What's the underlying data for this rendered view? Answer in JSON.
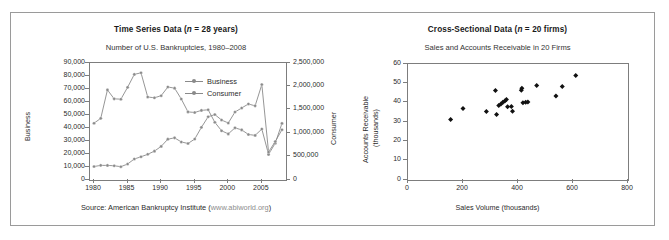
{
  "figure": {
    "border_color": "#9a9a9a",
    "background": "#ffffff"
  },
  "panels": [
    {
      "id": "time-series",
      "title_main": "Time Series Data (",
      "title_ital": "n",
      "title_tail": " = 28 years)",
      "subtitle": "Number of U.S. Bankruptcies, 1980–2008",
      "caption_prefix": "Source: American Bankruptcy Institute (",
      "caption_url": "www.abiworld.org",
      "caption_suffix": ")",
      "legend": [
        {
          "label": "Business",
          "color": "#8a8a8a"
        },
        {
          "label": "Consumer",
          "color": "#8a8a8a"
        }
      ]
    },
    {
      "id": "cross-sectional",
      "title_main": "Cross-Sectional Data (",
      "title_ital": "n",
      "title_tail": " = 20 firms)",
      "subtitle": "Sales and Accounts Receivable in 20 Firms"
    }
  ],
  "chart_data": [
    {
      "type": "line",
      "id": "time-series",
      "title": "Time Series Data (n = 28 years)",
      "subtitle": "Number of U.S. Bankruptcies, 1980–2008",
      "source": "Source: American Bankruptcy Institute (www.abiworld.org)",
      "xlabel": "",
      "x": [
        1980,
        1981,
        1982,
        1983,
        1984,
        1985,
        1986,
        1987,
        1988,
        1989,
        1990,
        1991,
        1992,
        1993,
        1994,
        1995,
        1996,
        1997,
        1998,
        1999,
        2000,
        2001,
        2002,
        2003,
        2004,
        2005,
        2006,
        2007,
        2008
      ],
      "xlim": [
        1979.4,
        2008.6
      ],
      "xticks": [
        1980,
        1985,
        1990,
        1995,
        2000,
        2005
      ],
      "grid": false,
      "legend_position": "top-center-right",
      "series": [
        {
          "name": "Business",
          "axis": "left",
          "ylabel": "Business",
          "ylim": [
            0,
            90000
          ],
          "yticks": [
            0,
            10000,
            20000,
            30000,
            40000,
            50000,
            60000,
            70000,
            80000,
            90000
          ],
          "ytick_labels": [
            "0",
            "10,000",
            "20,000",
            "30,000",
            "40,000",
            "50,000",
            "60,000",
            "70,000",
            "80,000",
            "90,000"
          ],
          "color": "#8a8a8a",
          "values": [
            43694,
            47415,
            69300,
            62436,
            62170,
            71277,
            81235,
            82446,
            63853,
            63235,
            64853,
            71549,
            70643,
            62304,
            52374,
            51959,
            53549,
            54027,
            44367,
            37884,
            35472,
            40099,
            38540,
            35037,
            34317,
            39201,
            19695,
            28322,
            43546
          ]
        },
        {
          "name": "Consumer",
          "axis": "right",
          "ylabel": "Consumer",
          "ylim": [
            0,
            2500000
          ],
          "yticks": [
            0,
            500000,
            1000000,
            1500000,
            2000000,
            2500000
          ],
          "ytick_labels": [
            "0",
            "500,000",
            "1,000,000",
            "1,500,000",
            "2,000,000",
            "2,500,000"
          ],
          "color": "#8a8a8a",
          "values": [
            287570,
            312914,
            311443,
            304261,
            284517,
            341233,
            449203,
            495553,
            549831,
            616753,
            718107,
            872438,
            900874,
            812898,
            780455,
            874642,
            1125006,
            1350118,
            1398182,
            1281581,
            1217972,
            1452030,
            1539111,
            1625208,
            1584170,
            2039214,
            597965,
            822590,
            1074225
          ]
        }
      ]
    },
    {
      "type": "scatter",
      "id": "cross-sectional",
      "title": "Cross-Sectional Data (n = 20 firms)",
      "subtitle": "Sales and Accounts Receivable in 20 Firms",
      "xlabel": "Sales Volume (thousands)",
      "ylabel": "Accounts Receivable (thousands)",
      "ylabel_line1": "Accounts Receivable",
      "ylabel_line2": "(thousands)",
      "xlim": [
        0,
        800
      ],
      "ylim": [
        0,
        60
      ],
      "xticks": [
        0,
        200,
        400,
        600,
        800
      ],
      "yticks": [
        0,
        10,
        20,
        30,
        40,
        50,
        60
      ],
      "grid": false,
      "marker": "diamond",
      "marker_color": "#111111",
      "points": [
        {
          "x": 155,
          "y": 31.3
        },
        {
          "x": 200,
          "y": 37.0
        },
        {
          "x": 285,
          "y": 35.4
        },
        {
          "x": 318,
          "y": 46.3
        },
        {
          "x": 322,
          "y": 33.9
        },
        {
          "x": 330,
          "y": 38.5
        },
        {
          "x": 338,
          "y": 39.3
        },
        {
          "x": 345,
          "y": 40.2
        },
        {
          "x": 352,
          "y": 40.8
        },
        {
          "x": 358,
          "y": 41.6
        },
        {
          "x": 362,
          "y": 37.9
        },
        {
          "x": 376,
          "y": 38.0
        },
        {
          "x": 380,
          "y": 35.6
        },
        {
          "x": 412,
          "y": 46.4
        },
        {
          "x": 414,
          "y": 47.4
        },
        {
          "x": 418,
          "y": 39.9
        },
        {
          "x": 428,
          "y": 40.2
        },
        {
          "x": 436,
          "y": 40.3
        },
        {
          "x": 468,
          "y": 48.9
        },
        {
          "x": 538,
          "y": 43.5
        },
        {
          "x": 561,
          "y": 48.3
        },
        {
          "x": 610,
          "y": 54.1
        }
      ]
    }
  ]
}
